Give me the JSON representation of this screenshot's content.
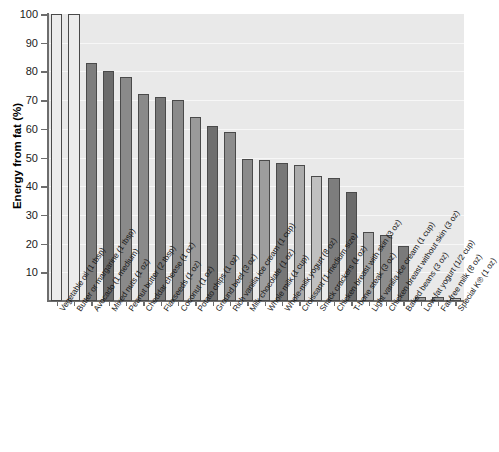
{
  "chart_data": {
    "type": "bar",
    "title": "",
    "xlabel": "",
    "ylabel": "Energy from fat (%)",
    "ylim": [
      0,
      100
    ],
    "ytick_labels": [
      "10",
      "20",
      "30",
      "40",
      "50",
      "60",
      "70",
      "80",
      "90",
      "100"
    ],
    "ytick_values": [
      10,
      20,
      30,
      40,
      50,
      60,
      70,
      80,
      90,
      100
    ],
    "grid": true,
    "legend": "none",
    "categories": [
      "Vegetable oil (1 tbsp)",
      "Butter or margarine (1 tbsp)",
      "Avocado (1 medium)",
      "Mixed nuts (1 oz)",
      "Peanut butter (2 tbsp)",
      "Cheddar cheese (1 oz)",
      "Flaxseeds (1 oz)",
      "Coconut (1 oz)",
      "Potato chips (1 oz)",
      "Ground beef (3 oz)",
      "Rich vanilla ice cream (1 cup)",
      "Milk chocolate (1 oz)",
      "Whole milk (1 cup)",
      "Whole-milk yogurt (8 oz)",
      "Croissant (1 medium size)",
      "Snack crackers (1 oz)",
      "Chicken breast with skin (3 oz)",
      "T-bone steak (3 oz)",
      "Light vanilla ice cream (1 cup)",
      "Chicken breast without skin (3 oz)",
      "Baked beans (3 oz)",
      "Low-fat yogurt (1/2 cup)",
      "Fat-free milk (8 oz)",
      "Special K® (1 oz)"
    ],
    "values": [
      100,
      100,
      83,
      80,
      78,
      72,
      71,
      70,
      64,
      61,
      59,
      49.5,
      49,
      48,
      47.5,
      43.5,
      43,
      38,
      24,
      23,
      19,
      1.5,
      1.5,
      1
    ],
    "bar_shades": [
      "#ececec",
      "#ececec",
      "#7d7d7d",
      "#6b6b6b",
      "#8a8a8a",
      "#8a8a8a",
      "#777777",
      "#8a8a8a",
      "#9a9a9a",
      "#6f6f6f",
      "#8d8d8d",
      "#8a8a8a",
      "#9d9d9d",
      "#777777",
      "#ababab",
      "#c0c0c0",
      "#7d7d7d",
      "#6b6b6b",
      "#a5a5a5",
      "#8d8d8d",
      "#7a7a7a",
      "#9a9a9a",
      "#9a9a9a",
      "#c0c0c0"
    ],
    "bar_border": "#4a4a4a",
    "plot_background": "#e9e9e9",
    "axis_color": "#6d6d6d"
  }
}
